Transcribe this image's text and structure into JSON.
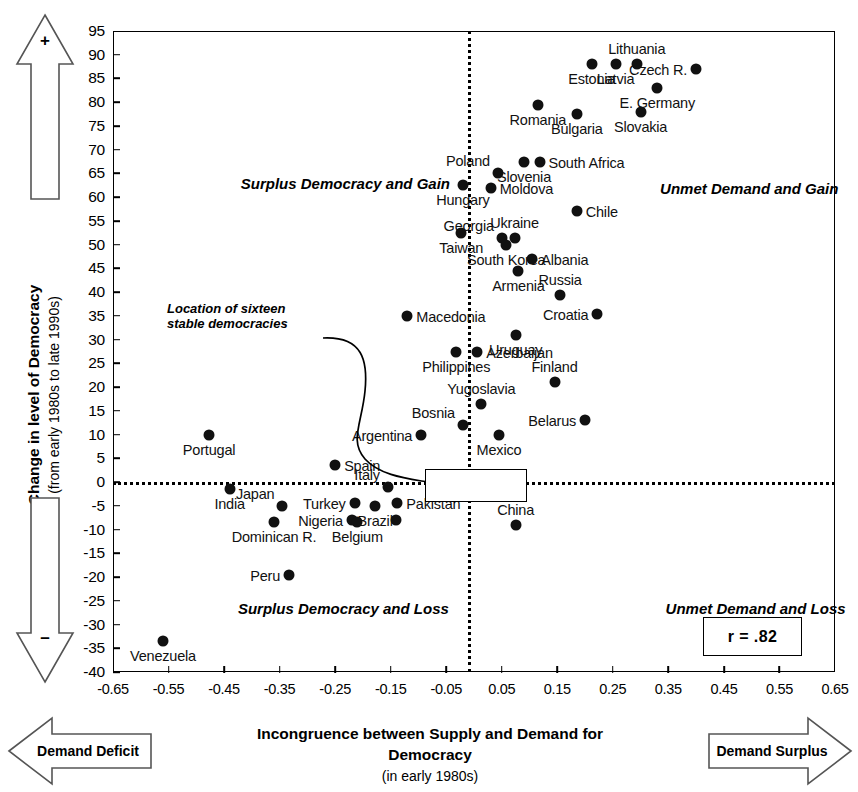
{
  "chart_data": {
    "type": "scatter",
    "title": "",
    "xlabel": "Incongruence between Supply and Demand for Democracy",
    "xlabel_sub": "(in early 1980s)",
    "ylabel": "Change in level of Democracy",
    "ylabel_sub": "(from early 1980s to late 1990s)",
    "xlim": [
      -0.65,
      0.65
    ],
    "ylim": [
      -40,
      95
    ],
    "xticks": [
      "-0.65",
      "-0.55",
      "-0.45",
      "-0.35",
      "-0.25",
      "-0.15",
      "-0.05",
      "0.05",
      "0.15",
      "0.25",
      "0.35",
      "0.45",
      "0.55",
      "0.65"
    ],
    "xtick_values": [
      -0.65,
      -0.55,
      -0.45,
      -0.35,
      -0.25,
      -0.15,
      -0.05,
      0.05,
      0.15,
      0.25,
      0.35,
      0.45,
      0.55,
      0.65
    ],
    "yticks": [
      "95",
      "90",
      "85",
      "80",
      "75",
      "70",
      "65",
      "60",
      "55",
      "50",
      "45",
      "40",
      "35",
      "30",
      "25",
      "20",
      "15",
      "10",
      "5",
      "0",
      "-5",
      "-10",
      "-15",
      "-20",
      "-25",
      "-30",
      "-35",
      "-40"
    ],
    "ytick_values": [
      95,
      90,
      85,
      80,
      75,
      70,
      65,
      60,
      55,
      50,
      45,
      40,
      35,
      30,
      25,
      20,
      15,
      10,
      5,
      0,
      -5,
      -10,
      -15,
      -20,
      -25,
      -30,
      -35,
      -40
    ],
    "grid": false,
    "legend": "none",
    "reference_lines": {
      "horizontal": 0,
      "vertical": -0.01,
      "style": "dotted"
    },
    "correlation_label": "r = .82",
    "points": [
      {
        "name": "Lithuania",
        "x": 0.293,
        "y": 88.0,
        "label_pos": "above"
      },
      {
        "name": "Latvia",
        "x": 0.255,
        "y": 88.0,
        "label_pos": "below"
      },
      {
        "name": "Estonia",
        "x": 0.212,
        "y": 88.0,
        "label_pos": "below"
      },
      {
        "name": "Czech R.",
        "x": 0.4,
        "y": 87.0,
        "label_pos": "left"
      },
      {
        "name": "E. Germany",
        "x": 0.33,
        "y": 83.0,
        "label_pos": "below"
      },
      {
        "name": "Romania",
        "x": 0.115,
        "y": 79.5,
        "label_pos": "below"
      },
      {
        "name": "Slovakia",
        "x": 0.3,
        "y": 78.0,
        "label_pos": "below"
      },
      {
        "name": "Bulgaria",
        "x": 0.185,
        "y": 77.5,
        "label_pos": "below"
      },
      {
        "name": "Slovenia",
        "x": 0.09,
        "y": 67.5,
        "label_pos": "below"
      },
      {
        "name": "South Africa",
        "x": 0.118,
        "y": 67.5,
        "label_pos": "right"
      },
      {
        "name": "Poland",
        "x": 0.043,
        "y": 65.0,
        "label_pos": "above-left"
      },
      {
        "name": "Moldova",
        "x": 0.03,
        "y": 62.0,
        "label_pos": "right"
      },
      {
        "name": "Hungary",
        "x": -0.02,
        "y": 62.5,
        "label_pos": "below"
      },
      {
        "name": "Chile",
        "x": 0.185,
        "y": 57.0,
        "label_pos": "right"
      },
      {
        "name": "Ukraine",
        "x": 0.073,
        "y": 51.5,
        "label_pos": "above"
      },
      {
        "name": "Georgia",
        "x": 0.05,
        "y": 51.5,
        "label_pos": "above-left"
      },
      {
        "name": "South Korea",
        "x": 0.058,
        "y": 50.0,
        "label_pos": "below"
      },
      {
        "name": "Taiwan",
        "x": -0.023,
        "y": 52.5,
        "label_pos": "below"
      },
      {
        "name": "Albania",
        "x": 0.105,
        "y": 47.0,
        "label_pos": "right"
      },
      {
        "name": "Armenia",
        "x": 0.08,
        "y": 44.5,
        "label_pos": "below"
      },
      {
        "name": "Russia",
        "x": 0.155,
        "y": 39.5,
        "label_pos": "above"
      },
      {
        "name": "Croatia",
        "x": 0.222,
        "y": 35.5,
        "label_pos": "left"
      },
      {
        "name": "Macedonia",
        "x": -0.12,
        "y": 35.0,
        "label_pos": "right"
      },
      {
        "name": "Uruguay",
        "x": 0.075,
        "y": 31.0,
        "label_pos": "below"
      },
      {
        "name": "Azerbaijan",
        "x": 0.006,
        "y": 27.5,
        "label_pos": "right"
      },
      {
        "name": "Philippines",
        "x": -0.032,
        "y": 27.5,
        "label_pos": "below"
      },
      {
        "name": "Finland",
        "x": 0.145,
        "y": 21.0,
        "label_pos": "above"
      },
      {
        "name": "Yugoslavia",
        "x": 0.013,
        "y": 16.5,
        "label_pos": "above"
      },
      {
        "name": "Belarus",
        "x": 0.2,
        "y": 13.0,
        "label_pos": "left"
      },
      {
        "name": "Bosnia",
        "x": -0.02,
        "y": 12.0,
        "label_pos": "above-left"
      },
      {
        "name": "Argentina",
        "x": -0.095,
        "y": 10.0,
        "label_pos": "left"
      },
      {
        "name": "Portugal",
        "x": -0.477,
        "y": 10.0,
        "label_pos": "below"
      },
      {
        "name": "Mexico",
        "x": 0.045,
        "y": 10.0,
        "label_pos": "below"
      },
      {
        "name": "Spain",
        "x": -0.25,
        "y": 3.5,
        "label_pos": "right"
      },
      {
        "name": "Italy",
        "x": -0.155,
        "y": -1.0,
        "label_pos": "above-left"
      },
      {
        "name": "India",
        "x": -0.44,
        "y": -1.5,
        "label_pos": "below"
      },
      {
        "name": "Turkey",
        "x": -0.215,
        "y": -4.5,
        "label_pos": "left"
      },
      {
        "name": "Pakistan",
        "x": -0.138,
        "y": -4.5,
        "label_pos": "right"
      },
      {
        "name": "Japan",
        "x": -0.345,
        "y": -5.0,
        "label_pos": "above-left"
      },
      {
        "name": "Brazil",
        "x": -0.178,
        "y": -5.0,
        "label_pos": "below"
      },
      {
        "name": "Nigeria",
        "x": -0.22,
        "y": -8.0,
        "label_pos": "left"
      },
      {
        "name": "Belgium",
        "x": -0.21,
        "y": -8.5,
        "label_pos": "below"
      },
      {
        "name": "Dominican R.",
        "x": -0.36,
        "y": -8.5,
        "label_pos": "below"
      },
      {
        "name": "Brazil2",
        "x": -0.14,
        "y": -8.0,
        "label_pos": "none"
      },
      {
        "name": "China",
        "x": 0.075,
        "y": -9.0,
        "label_pos": "above"
      },
      {
        "name": "Peru",
        "x": -0.333,
        "y": -19.5,
        "label_pos": "left"
      },
      {
        "name": "Venezuela",
        "x": -0.56,
        "y": -33.5,
        "label_pos": "below"
      }
    ],
    "quadrant_labels": [
      {
        "text": "Surplus Democracy and Gain",
        "x": -0.42,
        "y": 63.0
      },
      {
        "text": "Unmet Demand and Gain",
        "x": 0.335,
        "y": 62.0
      },
      {
        "text": "Surplus Democracy and Loss",
        "x": -0.425,
        "y": -26.5
      },
      {
        "text": "Unmet Demand and Loss",
        "x": 0.345,
        "y": -26.5
      }
    ],
    "annotation": {
      "line1": "Location of sixteen",
      "line2": "stable democracies"
    }
  },
  "axis_arrows": {
    "y_positive_sign": "+",
    "y_negative_sign": "–",
    "x_left_label": "Demand Deficit",
    "x_right_label": "Demand Surplus"
  }
}
